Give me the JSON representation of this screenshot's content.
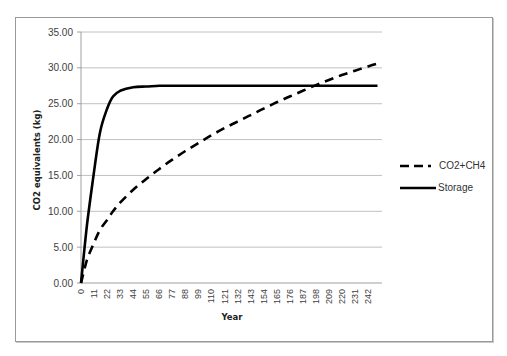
{
  "chart_data": {
    "type": "line",
    "title": "",
    "xlabel": "Year",
    "ylabel": "CO2 equivalents (kg)",
    "ylim": [
      0,
      35
    ],
    "yticks": [
      "0.00",
      "5.00",
      "10.00",
      "15.00",
      "20.00",
      "25.00",
      "30.00",
      "35.00"
    ],
    "xticks": [
      "0",
      "11",
      "22",
      "33",
      "44",
      "55",
      "66",
      "77",
      "88",
      "99",
      "110",
      "121",
      "132",
      "143",
      "154",
      "165",
      "176",
      "187",
      "198",
      "209",
      "220",
      "231",
      "242"
    ],
    "grid": {
      "horizontal": true,
      "vertical": false
    },
    "legend_position": "right",
    "x": [
      0,
      5,
      11,
      16,
      22,
      27,
      33,
      44,
      55,
      66,
      77,
      88,
      99,
      110,
      121,
      132,
      143,
      154,
      165,
      176,
      187,
      198,
      209,
      220,
      231,
      242,
      250
    ],
    "series": [
      {
        "name": "CO2+CH4",
        "style": "dashed",
        "values": [
          0,
          3.2,
          5.6,
          7.4,
          8.8,
          10.0,
          11.2,
          13.0,
          14.5,
          15.9,
          17.2,
          18.4,
          19.5,
          20.6,
          21.6,
          22.5,
          23.4,
          24.3,
          25.2,
          26.0,
          26.8,
          27.6,
          28.3,
          29.0,
          29.6,
          30.2,
          30.6
        ]
      },
      {
        "name": "Storage",
        "style": "solid",
        "values": [
          0,
          8.0,
          15.5,
          21.0,
          24.3,
          26.0,
          26.8,
          27.3,
          27.4,
          27.5,
          27.5,
          27.5,
          27.5,
          27.5,
          27.5,
          27.5,
          27.5,
          27.5,
          27.5,
          27.5,
          27.5,
          27.5,
          27.5,
          27.5,
          27.5,
          27.5,
          27.5
        ]
      }
    ]
  },
  "legend": [
    {
      "label": "CO2+CH4",
      "style": "dashed"
    },
    {
      "label": "Storage",
      "style": "solid"
    }
  ],
  "colors": {
    "line": "#000000",
    "grid": "#c0c0c0",
    "axis": "#a0a0a0",
    "border": "#9a9a9a"
  }
}
